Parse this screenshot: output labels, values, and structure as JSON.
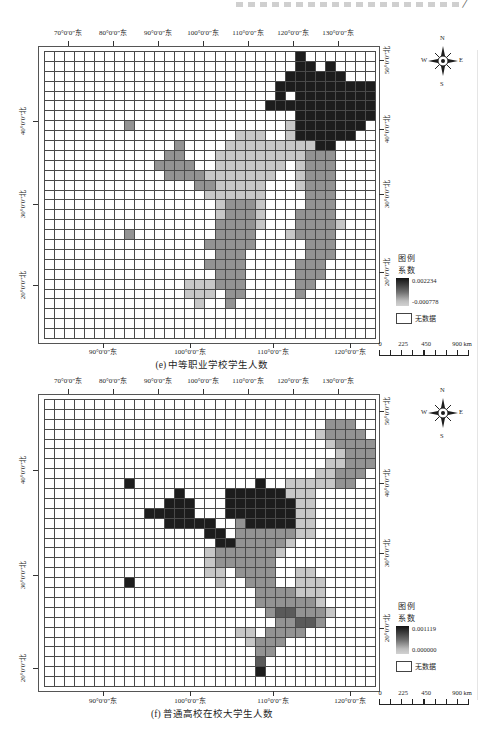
{
  "header": {
    "slash": "/"
  },
  "shades": {
    "D": "#1d1d1d",
    "G": "#5a5a5a",
    "M": "#939393",
    "L": "#c7c7c7"
  },
  "grid_size": {
    "cols": 33,
    "rows": 29
  },
  "panels": [
    {
      "caption": "(e) 中等职业学校学生人数",
      "top_axis": [
        "70°0′0″东",
        "80°0′0″东",
        "90°0′0″东",
        "100°0′0″东",
        "110°0′0″东",
        "120°0′0″东",
        "130°0′0″东"
      ],
      "bottom_axis": [
        "90°0′0″东",
        "100°0′0″东",
        "110°0′0″东",
        "120°0′0″东"
      ],
      "left_axis": [
        "40°0′0″北",
        "30°0′0″北",
        "20°0′0″北"
      ],
      "right_axis": [
        "50°0′0″北",
        "40°0′0″北",
        "30°0′0″北",
        "20°0′0″北"
      ],
      "legend": {
        "title": "图例",
        "subtitle": "系数",
        "max": "0.002234",
        "min": "-0.000778",
        "nodata": "无数据"
      },
      "scalebar": [
        "0",
        "225",
        "450",
        "900 km"
      ],
      "compass": {
        "n": "N",
        "e": "E",
        "s": "S",
        "w": "W"
      },
      "grid_runs": [
        [
          0,
          25,
          25,
          "D"
        ],
        [
          1,
          25,
          26,
          "D"
        ],
        [
          1,
          28,
          28,
          "D"
        ],
        [
          2,
          24,
          29,
          "D"
        ],
        [
          3,
          23,
          32,
          "D"
        ],
        [
          4,
          23,
          23,
          "D"
        ],
        [
          4,
          25,
          32,
          "D"
        ],
        [
          5,
          22,
          32,
          "D"
        ],
        [
          6,
          25,
          32,
          "D"
        ],
        [
          7,
          8,
          8,
          "M"
        ],
        [
          7,
          24,
          24,
          "L"
        ],
        [
          7,
          25,
          31,
          "D"
        ],
        [
          8,
          19,
          21,
          "L"
        ],
        [
          8,
          24,
          24,
          "L"
        ],
        [
          8,
          25,
          30,
          "D"
        ],
        [
          9,
          13,
          13,
          "M"
        ],
        [
          9,
          18,
          26,
          "L"
        ],
        [
          9,
          27,
          28,
          "D"
        ],
        [
          10,
          12,
          13,
          "M"
        ],
        [
          10,
          17,
          25,
          "L"
        ],
        [
          10,
          26,
          28,
          "M"
        ],
        [
          11,
          11,
          14,
          "M"
        ],
        [
          11,
          17,
          23,
          "L"
        ],
        [
          11,
          25,
          25,
          "L"
        ],
        [
          11,
          26,
          28,
          "M"
        ],
        [
          12,
          12,
          15,
          "M"
        ],
        [
          12,
          16,
          22,
          "L"
        ],
        [
          12,
          25,
          25,
          "L"
        ],
        [
          12,
          26,
          28,
          "M"
        ],
        [
          13,
          15,
          16,
          "M"
        ],
        [
          13,
          17,
          21,
          "L"
        ],
        [
          13,
          25,
          25,
          "L"
        ],
        [
          13,
          26,
          28,
          "M"
        ],
        [
          14,
          16,
          21,
          "L"
        ],
        [
          14,
          26,
          28,
          "M"
        ],
        [
          15,
          17,
          17,
          "L"
        ],
        [
          15,
          18,
          20,
          "M"
        ],
        [
          15,
          21,
          21,
          "L"
        ],
        [
          15,
          26,
          28,
          "M"
        ],
        [
          16,
          17,
          17,
          "L"
        ],
        [
          16,
          18,
          20,
          "M"
        ],
        [
          16,
          21,
          21,
          "L"
        ],
        [
          16,
          25,
          28,
          "M"
        ],
        [
          17,
          17,
          20,
          "M"
        ],
        [
          17,
          21,
          21,
          "L"
        ],
        [
          17,
          25,
          28,
          "M"
        ],
        [
          17,
          29,
          29,
          "L"
        ],
        [
          18,
          8,
          8,
          "M"
        ],
        [
          18,
          17,
          20,
          "M"
        ],
        [
          18,
          24,
          24,
          "L"
        ],
        [
          18,
          25,
          28,
          "M"
        ],
        [
          19,
          16,
          20,
          "M"
        ],
        [
          19,
          26,
          28,
          "M"
        ],
        [
          20,
          17,
          19,
          "M"
        ],
        [
          20,
          26,
          28,
          "M"
        ],
        [
          21,
          16,
          19,
          "M"
        ],
        [
          21,
          25,
          27,
          "M"
        ],
        [
          22,
          17,
          19,
          "M"
        ],
        [
          22,
          25,
          27,
          "M"
        ],
        [
          23,
          14,
          16,
          "L"
        ],
        [
          23,
          17,
          19,
          "M"
        ],
        [
          23,
          25,
          26,
          "M"
        ],
        [
          24,
          14,
          16,
          "L"
        ],
        [
          24,
          18,
          19,
          "M"
        ],
        [
          24,
          25,
          25,
          "M"
        ],
        [
          25,
          15,
          15,
          "L"
        ],
        [
          25,
          18,
          18,
          "M"
        ]
      ]
    },
    {
      "caption": "(f) 普通高校在校大学生人数",
      "top_axis": [
        "70°0′0″东",
        "80°0′0″东",
        "90°0′0″东",
        "100°0′0″东",
        "110°0′0″东",
        "120°0′0″东",
        "130°0′0″东"
      ],
      "bottom_axis": [
        "90°0′0″东",
        "100°0′0″东",
        "110°0′0″东",
        "120°0′0″东"
      ],
      "left_axis": [
        "40°0′0″北",
        "30°0′0″北",
        "20°0′0″北"
      ],
      "right_axis": [
        "50°0′0″北",
        "40°0′0″北",
        "30°0′0″北",
        "20°0′0″北"
      ],
      "legend": {
        "title": "图例",
        "subtitle": "系数",
        "max": "0.001119",
        "min": "0.000000",
        "nodata": "无数据"
      },
      "scalebar": [
        "0",
        "225",
        "450",
        "900 km"
      ],
      "compass": {
        "n": "N",
        "e": "E",
        "s": "S",
        "w": "W"
      },
      "grid_runs": [
        [
          2,
          28,
          30,
          "M"
        ],
        [
          3,
          27,
          27,
          "L"
        ],
        [
          3,
          28,
          31,
          "M"
        ],
        [
          4,
          28,
          28,
          "L"
        ],
        [
          4,
          29,
          32,
          "M"
        ],
        [
          5,
          29,
          29,
          "L"
        ],
        [
          5,
          30,
          32,
          "M"
        ],
        [
          6,
          28,
          29,
          "L"
        ],
        [
          6,
          30,
          32,
          "M"
        ],
        [
          7,
          27,
          28,
          "L"
        ],
        [
          7,
          29,
          31,
          "M"
        ],
        [
          8,
          8,
          8,
          "D"
        ],
        [
          8,
          21,
          21,
          "D"
        ],
        [
          8,
          24,
          28,
          "L"
        ],
        [
          8,
          29,
          30,
          "M"
        ],
        [
          9,
          13,
          13,
          "D"
        ],
        [
          9,
          18,
          23,
          "D"
        ],
        [
          9,
          24,
          26,
          "L"
        ],
        [
          10,
          12,
          14,
          "D"
        ],
        [
          10,
          18,
          24,
          "D"
        ],
        [
          10,
          25,
          26,
          "L"
        ],
        [
          11,
          10,
          14,
          "D"
        ],
        [
          11,
          18,
          24,
          "D"
        ],
        [
          11,
          25,
          26,
          "L"
        ],
        [
          12,
          12,
          16,
          "D"
        ],
        [
          12,
          19,
          19,
          "M"
        ],
        [
          12,
          20,
          24,
          "D"
        ],
        [
          12,
          25,
          26,
          "L"
        ],
        [
          13,
          16,
          17,
          "D"
        ],
        [
          13,
          19,
          24,
          "M"
        ],
        [
          13,
          25,
          26,
          "L"
        ],
        [
          14,
          17,
          18,
          "D"
        ],
        [
          14,
          19,
          23,
          "M"
        ],
        [
          14,
          24,
          24,
          "L"
        ],
        [
          15,
          16,
          16,
          "L"
        ],
        [
          15,
          17,
          22,
          "M"
        ],
        [
          15,
          23,
          23,
          "L"
        ],
        [
          16,
          16,
          16,
          "L"
        ],
        [
          16,
          17,
          22,
          "M"
        ],
        [
          17,
          16,
          17,
          "L"
        ],
        [
          17,
          19,
          22,
          "M"
        ],
        [
          17,
          25,
          26,
          "L"
        ],
        [
          18,
          8,
          8,
          "D"
        ],
        [
          18,
          17,
          17,
          "L"
        ],
        [
          18,
          20,
          22,
          "M"
        ],
        [
          18,
          25,
          27,
          "L"
        ],
        [
          19,
          21,
          24,
          "M"
        ],
        [
          19,
          25,
          27,
          "L"
        ],
        [
          20,
          21,
          26,
          "M"
        ],
        [
          20,
          27,
          27,
          "L"
        ],
        [
          21,
          22,
          22,
          "M"
        ],
        [
          21,
          23,
          24,
          "G"
        ],
        [
          21,
          25,
          27,
          "M"
        ],
        [
          21,
          28,
          28,
          "L"
        ],
        [
          22,
          23,
          24,
          "M"
        ],
        [
          22,
          25,
          26,
          "G"
        ],
        [
          22,
          27,
          27,
          "M"
        ],
        [
          23,
          19,
          20,
          "L"
        ],
        [
          23,
          22,
          25,
          "M"
        ],
        [
          24,
          20,
          20,
          "L"
        ],
        [
          24,
          21,
          23,
          "M"
        ],
        [
          25,
          21,
          22,
          "M"
        ],
        [
          26,
          21,
          21,
          "G"
        ],
        [
          27,
          21,
          21,
          "D"
        ]
      ]
    }
  ]
}
